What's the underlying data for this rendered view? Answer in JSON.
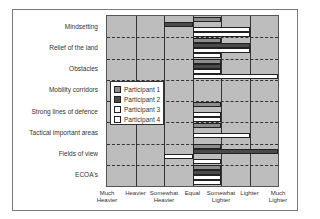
{
  "chart_data": {
    "type": "bar",
    "orientation": "horizontal",
    "title": "",
    "xlabel": "",
    "ylabel": "",
    "x_ticks": [
      "Much Heavier",
      "Heavier",
      "Somewhat Heavier",
      "Equal",
      "Somewhat Lighter",
      "Lighter",
      "Much Lighter"
    ],
    "x_values": [
      -3,
      -2,
      -1,
      0,
      1,
      2,
      3
    ],
    "xlim": [
      -3,
      3
    ],
    "grid": true,
    "legend_position": "inside-left",
    "categories": [
      "Mindsetting",
      "Relief of the land",
      "Obstacles",
      "Mobility corridors",
      "Strong lines of defence",
      "Tactical important areas",
      "Fields of view",
      "ECOA's"
    ],
    "series": [
      {
        "name": "Participant 1",
        "color": "#8c8c8c",
        "values": [
          1,
          1,
          1,
          0,
          1,
          1,
          1,
          1
        ]
      },
      {
        "name": "Participant 2",
        "color": "#4a4a4a",
        "values": [
          -1,
          2,
          1,
          0,
          0,
          0,
          3,
          1
        ]
      },
      {
        "name": "Participant 3",
        "color": "#ffffff",
        "values": [
          2,
          2,
          1,
          0,
          1,
          2,
          -1,
          1
        ]
      },
      {
        "name": "Participant 4",
        "color": "#ffffff",
        "values": [
          2,
          1,
          3,
          0,
          1,
          0,
          1,
          1
        ]
      }
    ]
  },
  "labels": {
    "rows": [
      "Mindsetting",
      "Relief of the land",
      "Obstacles",
      "Mobility corridors",
      "Strong lines of defence",
      "Tactical important areas",
      "Fields of view",
      "ECOA's"
    ],
    "x_ticks": [
      {
        "line1": "Much",
        "line2": "Heavier"
      },
      {
        "line1": "Heavier",
        "line2": ""
      },
      {
        "line1": "Somewhat",
        "line2": "Heavier"
      },
      {
        "line1": "Equal",
        "line2": ""
      },
      {
        "line1": "Somewhat",
        "line2": "Lighter"
      },
      {
        "line1": "Lighter",
        "line2": ""
      },
      {
        "line1": "Much",
        "line2": "Lighter"
      }
    ],
    "legend": [
      "Participant 1",
      "Participant 2",
      "Participant 3",
      "Participant 4"
    ]
  }
}
